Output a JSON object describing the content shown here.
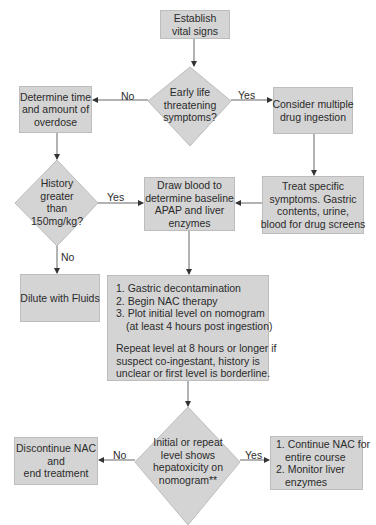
{
  "colors": {
    "box_fill": "#d4d4d4",
    "box_border": "#bdbdbd",
    "line": "#555555",
    "text": "#2b2b2b",
    "background": "#ffffff"
  },
  "nodes": {
    "start": {
      "type": "process",
      "lines": [
        "Establish",
        "vital signs"
      ]
    },
    "decision_early": {
      "type": "decision",
      "lines": [
        "Early life",
        "threatening",
        "symptoms?"
      ]
    },
    "determine_time": {
      "type": "process",
      "lines": [
        "Determine time",
        "and amount of",
        "overdose"
      ]
    },
    "consider_multiple": {
      "type": "process",
      "lines": [
        "Consider multiple",
        "drug ingestion"
      ]
    },
    "treat_specific": {
      "type": "process",
      "lines": [
        "Treat specific",
        "symptoms. Gastric",
        "contents, urine,",
        "blood for drug screens"
      ]
    },
    "decision_history": {
      "type": "decision",
      "lines": [
        "History",
        "greater",
        "than",
        "150mg/kg?"
      ]
    },
    "draw_blood": {
      "type": "process",
      "lines": [
        "Draw blood to",
        "determine baseline",
        "APAP and liver",
        "enzymes"
      ]
    },
    "dilute": {
      "type": "process",
      "lines": [
        "Dilute with Fluids"
      ]
    },
    "steps": {
      "type": "process",
      "items": [
        "1. Gastric decontamination",
        "2. Begin NAC therapy",
        "3. Plot initial level on nomogram"
      ],
      "item3_cont": "(at least 4 hours post ingestion)",
      "note_lines": [
        "Repeat level at 8 hours or longer if",
        "suspect co-ingestant, history is",
        "unclear or first level is borderline."
      ]
    },
    "decision_hepatotox": {
      "type": "decision",
      "lines": [
        "Initial or repeat",
        "level shows",
        "hepatoxicity on",
        "nomogram**"
      ]
    },
    "discontinue": {
      "type": "process",
      "lines": [
        "Discontinue NAC",
        "and",
        "end treatment"
      ]
    },
    "continue": {
      "type": "process",
      "lines": [
        "1. Continue NAC for",
        "entire course",
        "2. Monitor liver",
        "enzymes"
      ]
    }
  },
  "edges": {
    "early_no": "No",
    "early_yes": "Yes",
    "history_yes": "Yes",
    "history_no": "No",
    "hepatotox_no": "No",
    "hepatotox_yes": "Yes"
  }
}
